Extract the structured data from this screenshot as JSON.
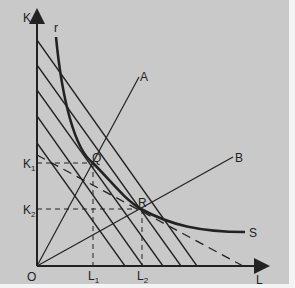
{
  "diagram": {
    "type": "isoquant-isocost",
    "axes": {
      "y_label": "K",
      "x_label": "L",
      "origin_label": "O"
    },
    "curve": {
      "start_label": "r",
      "end_label": "S"
    },
    "rays": [
      {
        "label": "A"
      },
      {
        "label": "B"
      }
    ],
    "points": [
      {
        "label": "Q"
      },
      {
        "label": "R"
      }
    ],
    "k_ticks": [
      {
        "label": "K",
        "sub": "1"
      },
      {
        "label": "K",
        "sub": "2"
      }
    ],
    "l_ticks": [
      {
        "label": "L",
        "sub": "1"
      },
      {
        "label": "L",
        "sub": "2"
      }
    ],
    "colors": {
      "background": "#c9c9c9",
      "ink": "#222222"
    }
  }
}
